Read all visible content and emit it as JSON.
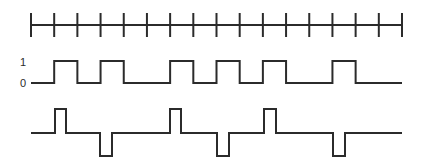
{
  "diagram": {
    "type": "digital-signal-encoding",
    "timeline": {
      "x_start": 31,
      "x_end": 402,
      "y": 25,
      "tick_count": 17,
      "tick_top": 13,
      "tick_bottom": 37
    },
    "signal_binary": {
      "label_high": "1",
      "label_low": "0",
      "y_high": 61,
      "y_low": 83,
      "bits": [
        0,
        1,
        0,
        1,
        0,
        0,
        1,
        0,
        1,
        0,
        1,
        0,
        0,
        1,
        0,
        0
      ]
    },
    "signal_encoded": {
      "y_base": 133,
      "y_high": 109,
      "y_low": 156,
      "pulses": [
        {
          "x1": 55,
          "x2": 66,
          "dir": "up"
        },
        {
          "x1": 100,
          "x2": 112,
          "dir": "down"
        },
        {
          "x1": 170,
          "x2": 181,
          "dir": "up"
        },
        {
          "x1": 217,
          "x2": 229,
          "dir": "down"
        },
        {
          "x1": 264,
          "x2": 276,
          "dir": "up"
        },
        {
          "x1": 333,
          "x2": 345,
          "dir": "down"
        }
      ]
    }
  }
}
